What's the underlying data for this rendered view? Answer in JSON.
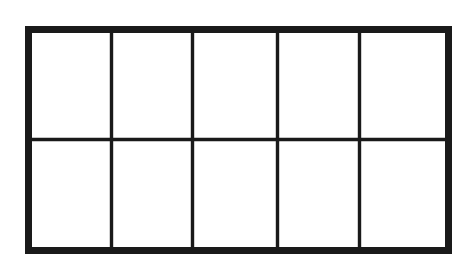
{
  "figure": {
    "name": "grid-rectangle-diagram",
    "shape": "rectangle",
    "columns": 5,
    "rows": 2,
    "total_cells": 10,
    "shaded_cells": 0,
    "unshaded_cells": 10,
    "fraction_shaded": "0/10",
    "colors": {
      "stroke": "#1a1a1a",
      "fill": "#ffffff",
      "background": "#ffffff"
    },
    "geometry": {
      "outer_x": 25,
      "outer_y": 26,
      "outer_width": 427,
      "outer_height": 228,
      "outer_border_width": 7,
      "inner_line_width": 3,
      "vertical_divider_x": [
        86,
        167,
        252,
        334
      ],
      "horizontal_divider_y": [
        113
      ]
    },
    "cells": [
      {
        "id": "cell-r1c1",
        "row": 1,
        "col": 1,
        "filled": false,
        "label": ""
      },
      {
        "id": "cell-r1c2",
        "row": 1,
        "col": 2,
        "filled": false,
        "label": ""
      },
      {
        "id": "cell-r1c3",
        "row": 1,
        "col": 3,
        "filled": false,
        "label": ""
      },
      {
        "id": "cell-r1c4",
        "row": 1,
        "col": 4,
        "filled": false,
        "label": ""
      },
      {
        "id": "cell-r1c5",
        "row": 1,
        "col": 5,
        "filled": false,
        "label": ""
      },
      {
        "id": "cell-r2c1",
        "row": 2,
        "col": 1,
        "filled": false,
        "label": ""
      },
      {
        "id": "cell-r2c2",
        "row": 2,
        "col": 2,
        "filled": false,
        "label": ""
      },
      {
        "id": "cell-r2c3",
        "row": 2,
        "col": 3,
        "filled": false,
        "label": ""
      },
      {
        "id": "cell-r2c4",
        "row": 2,
        "col": 4,
        "filled": false,
        "label": ""
      },
      {
        "id": "cell-r2c5",
        "row": 2,
        "col": 5,
        "filled": false,
        "label": ""
      }
    ]
  }
}
